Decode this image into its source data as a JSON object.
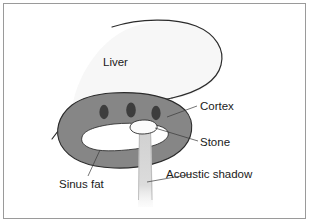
{
  "figure": {
    "frame_color": "#9a9a9a",
    "background_color": "#ffffff"
  },
  "colors": {
    "liver_fill": "#f7f7f7",
    "cortex_fill": "#868686",
    "sinus_fill": "#ffffff",
    "calyx_fill": "#3d3d3d",
    "stone_fill": "#fbfbfb",
    "shadow_fill": "#d8d8d8",
    "outline": "#2b2b2b",
    "leader": "#3a3a3a",
    "text": "#1a1a1a"
  },
  "labels": {
    "liver": "Liver",
    "cortex": "Cortex",
    "stone": "Stone",
    "sinus_fat": "Sinus fat",
    "acoustic_shadow": "Acoustic shadow"
  },
  "structures": {
    "liver": {
      "name": "Liver",
      "shading": "very-light-gray"
    },
    "cortex": {
      "name": "Renal cortex",
      "shading": "medium-gray"
    },
    "sinus_fat": {
      "name": "Sinus fat",
      "shading": "white"
    },
    "calyces": {
      "name": "Calyces",
      "count": 3,
      "shading": "dark-gray"
    },
    "stone": {
      "name": "Stone",
      "shading": "white-echogenic"
    },
    "acoustic_shadow": {
      "name": "Acoustic shadow",
      "shading": "light-gray-band"
    }
  }
}
